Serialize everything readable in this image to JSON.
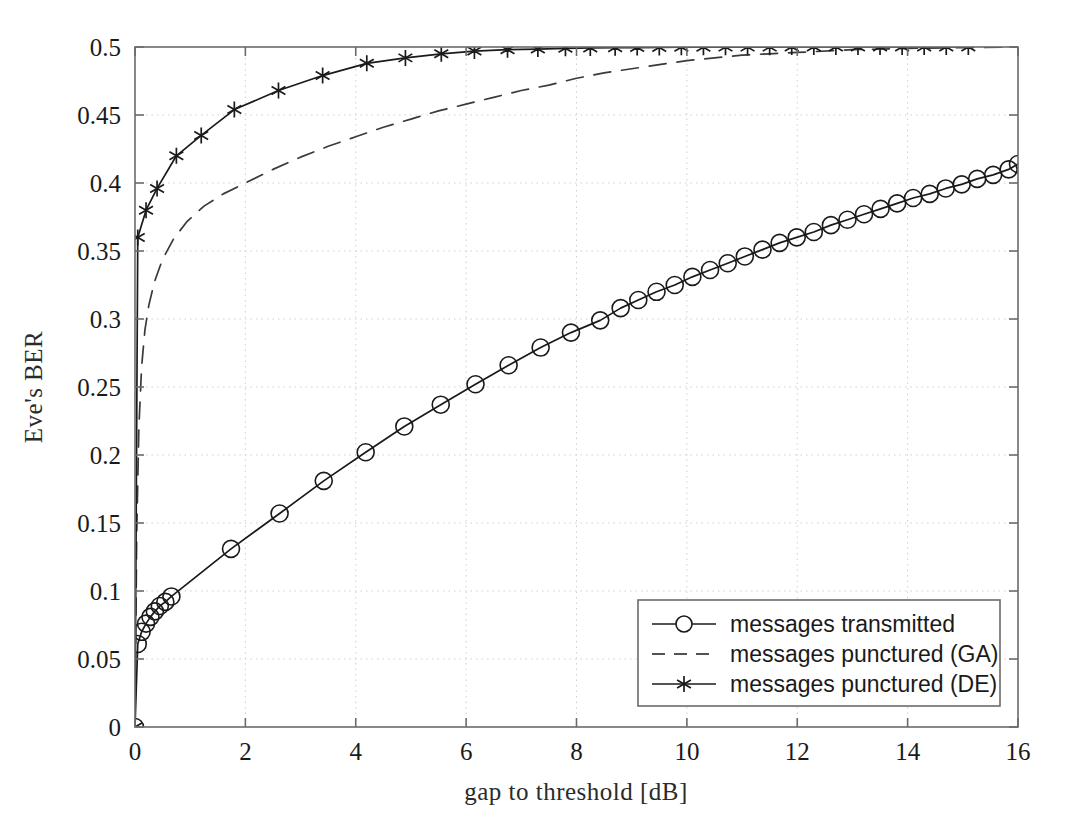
{
  "chart_data": {
    "type": "line",
    "title": "",
    "xlabel": "gap to threshold [dB]",
    "ylabel": "Eve's BER",
    "xlim": [
      0,
      16
    ],
    "ylim": [
      0,
      0.5
    ],
    "xticks": [
      0,
      2,
      4,
      6,
      8,
      10,
      12,
      14,
      16
    ],
    "xtick_labels": [
      "0",
      "2",
      "4",
      "6",
      "8",
      "10",
      "12",
      "14",
      "16"
    ],
    "yticks": [
      0,
      0.05,
      0.1,
      0.15,
      0.2,
      0.25,
      0.3,
      0.35,
      0.4,
      0.45,
      0.5
    ],
    "ytick_labels": [
      "0",
      "0.05",
      "0.1",
      "0.15",
      "0.2",
      "0.25",
      "0.3",
      "0.35",
      "0.4",
      "0.45",
      "0.5"
    ],
    "grid": true,
    "grid_style": "dotted",
    "legend_position": "lower right",
    "series": [
      {
        "name": "messages transmitted",
        "marker": "circle",
        "linestyle": "solid",
        "color": "#1a1a1a",
        "points": [
          [
            0.0,
            0.0
          ],
          [
            0.05,
            0.061
          ],
          [
            0.12,
            0.07
          ],
          [
            0.2,
            0.076
          ],
          [
            0.28,
            0.081
          ],
          [
            0.36,
            0.085
          ],
          [
            0.45,
            0.089
          ],
          [
            0.55,
            0.092
          ],
          [
            0.66,
            0.096
          ],
          [
            1.74,
            0.131
          ],
          [
            2.62,
            0.157
          ],
          [
            3.42,
            0.181
          ],
          [
            4.18,
            0.202
          ],
          [
            4.88,
            0.221
          ],
          [
            5.54,
            0.237
          ],
          [
            6.17,
            0.252
          ],
          [
            6.77,
            0.266
          ],
          [
            7.35,
            0.279
          ],
          [
            7.9,
            0.29
          ],
          [
            8.43,
            0.299
          ],
          [
            8.8,
            0.308
          ],
          [
            9.12,
            0.314
          ],
          [
            9.45,
            0.32
          ],
          [
            9.78,
            0.325
          ],
          [
            10.1,
            0.331
          ],
          [
            10.42,
            0.336
          ],
          [
            10.74,
            0.341
          ],
          [
            11.05,
            0.346
          ],
          [
            11.37,
            0.351
          ],
          [
            11.68,
            0.356
          ],
          [
            11.99,
            0.36
          ],
          [
            12.3,
            0.364
          ],
          [
            12.61,
            0.369
          ],
          [
            12.91,
            0.373
          ],
          [
            13.21,
            0.377
          ],
          [
            13.51,
            0.381
          ],
          [
            13.81,
            0.385
          ],
          [
            14.1,
            0.389
          ],
          [
            14.4,
            0.392
          ],
          [
            14.69,
            0.396
          ],
          [
            14.98,
            0.399
          ],
          [
            15.26,
            0.403
          ],
          [
            15.55,
            0.406
          ],
          [
            15.83,
            0.41
          ],
          [
            16.0,
            0.414
          ]
        ]
      },
      {
        "name": "messages punctured (GA)",
        "marker": "none",
        "linestyle": "dashed",
        "color": "#3a3a3a",
        "points": [
          [
            0.0,
            0.0
          ],
          [
            0.03,
            0.14
          ],
          [
            0.07,
            0.22
          ],
          [
            0.12,
            0.265
          ],
          [
            0.18,
            0.292
          ],
          [
            0.25,
            0.31
          ],
          [
            0.35,
            0.327
          ],
          [
            0.5,
            0.344
          ],
          [
            0.7,
            0.359
          ],
          [
            0.95,
            0.372
          ],
          [
            1.25,
            0.383
          ],
          [
            1.6,
            0.392
          ],
          [
            2.0,
            0.4
          ],
          [
            2.5,
            0.41
          ],
          [
            3.0,
            0.419
          ],
          [
            3.5,
            0.427
          ],
          [
            4.0,
            0.434
          ],
          [
            4.5,
            0.441
          ],
          [
            5.0,
            0.447
          ],
          [
            5.5,
            0.453
          ],
          [
            6.0,
            0.458
          ],
          [
            6.5,
            0.463
          ],
          [
            7.0,
            0.468
          ],
          [
            7.5,
            0.472
          ],
          [
            8.0,
            0.477
          ],
          [
            8.5,
            0.481
          ],
          [
            9.0,
            0.484
          ],
          [
            9.5,
            0.487
          ],
          [
            10.0,
            0.49
          ],
          [
            10.5,
            0.492
          ],
          [
            11.0,
            0.494
          ],
          [
            11.5,
            0.495
          ],
          [
            12.0,
            0.496
          ],
          [
            13.0,
            0.498
          ],
          [
            14.0,
            0.499
          ],
          [
            15.0,
            0.4995
          ],
          [
            16.0,
            0.5
          ]
        ]
      },
      {
        "name": "messages punctured (DE)",
        "marker": "star",
        "linestyle": "solid",
        "color": "#1a1a1a",
        "points": [
          [
            0.0,
            0.0
          ],
          [
            0.05,
            0.36
          ],
          [
            0.2,
            0.38
          ],
          [
            0.4,
            0.396
          ],
          [
            0.75,
            0.42
          ],
          [
            1.2,
            0.435
          ],
          [
            1.8,
            0.454
          ],
          [
            2.6,
            0.468
          ],
          [
            3.4,
            0.479
          ],
          [
            4.2,
            0.488
          ],
          [
            4.9,
            0.492
          ],
          [
            5.55,
            0.495
          ],
          [
            6.15,
            0.497
          ],
          [
            6.75,
            0.498
          ],
          [
            7.3,
            0.4985
          ],
          [
            7.8,
            0.499
          ],
          [
            8.25,
            0.4993
          ],
          [
            8.7,
            0.4995
          ],
          [
            9.1,
            0.4996
          ],
          [
            9.5,
            0.4997
          ],
          [
            9.9,
            0.4998
          ],
          [
            10.3,
            0.4998
          ],
          [
            10.7,
            0.4999
          ],
          [
            11.1,
            0.4999
          ],
          [
            11.5,
            0.4999
          ],
          [
            11.9,
            0.5
          ],
          [
            12.3,
            0.5
          ],
          [
            12.7,
            0.5
          ],
          [
            13.1,
            0.5
          ],
          [
            13.5,
            0.5
          ],
          [
            13.9,
            0.5
          ],
          [
            14.3,
            0.5
          ],
          [
            14.7,
            0.5
          ],
          [
            15.1,
            0.5
          ]
        ]
      }
    ]
  },
  "legend": {
    "entries": [
      {
        "label": "messages transmitted",
        "marker": "circle",
        "linestyle": "solid"
      },
      {
        "label": "messages punctured (GA)",
        "marker": "none",
        "linestyle": "dashed"
      },
      {
        "label": "messages punctured (DE)",
        "marker": "star",
        "linestyle": "solid"
      }
    ]
  },
  "colors": {
    "axis": "#6b6b6b",
    "grid": "#cfcfcf",
    "series_primary": "#1a1a1a",
    "background": "#ffffff"
  }
}
